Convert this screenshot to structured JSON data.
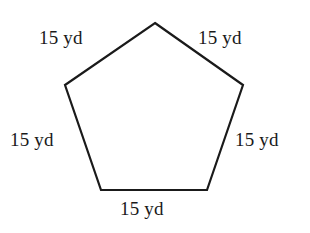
{
  "figure": {
    "shape_name": "regular-pentagon",
    "stroke_color": "#1a1a1a",
    "fill_color": "#ffffff",
    "background_color": "#ffffff",
    "label_color": "#1a1a1a",
    "vertices": [
      {
        "name": "apex",
        "x": 155,
        "y": 23
      },
      {
        "name": "upper-right",
        "x": 243,
        "y": 85
      },
      {
        "name": "lower-right",
        "x": 207,
        "y": 190
      },
      {
        "name": "lower-left",
        "x": 101,
        "y": 190
      },
      {
        "name": "upper-left",
        "x": 65,
        "y": 85
      }
    ],
    "points_attr": "155,23 243,85 207,190 101,190 65,85"
  },
  "labels": {
    "top_left": "15 yd",
    "top_right": "15 yd",
    "left": "15 yd",
    "right": "15 yd",
    "bottom": "15 yd"
  }
}
